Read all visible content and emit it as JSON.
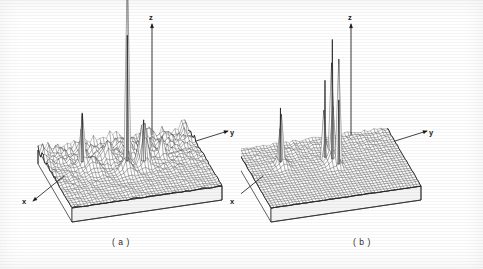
{
  "figure": {
    "background_color": "#ffffff",
    "ink_color": "#1a1a1a",
    "width": 483,
    "height": 269
  },
  "panels": [
    {
      "id": "a",
      "caption": "( a )",
      "axes": {
        "z_label": "z",
        "y_label": "y",
        "x_label": "x"
      }
    },
    {
      "id": "b",
      "caption": "( b )",
      "axes": {
        "z_label": "z",
        "y_label": "y",
        "x_label": "x"
      }
    }
  ],
  "chart_data": [
    {
      "type": "surface",
      "panel": "a",
      "title": "",
      "xlabel": "x",
      "ylabel": "y",
      "zlabel": "z",
      "grid": true,
      "legend": "none",
      "nx": 26,
      "ny": 46,
      "xlim": [
        0,
        1
      ],
      "ylim": [
        0,
        1
      ],
      "zlim": [
        0,
        1
      ],
      "description": "Dense rectangular wireframe mesh on a solid pedestal; one dominant tall central spike plus several medium peaks and a ridge of low-level clutter along the far edge.",
      "peaks": [
        {
          "name": "main-spike",
          "u": 0.5,
          "v": 0.42,
          "height": 1.0,
          "width": 0.012
        },
        {
          "name": "secondary-peak",
          "u": 0.6,
          "v": 0.46,
          "height": 0.34,
          "width": 0.03
        },
        {
          "name": "left-spike",
          "u": 0.22,
          "v": 0.33,
          "height": 0.4,
          "width": 0.016
        },
        {
          "name": "right-sidelobe",
          "u": 0.74,
          "v": 0.37,
          "height": 0.17,
          "width": 0.022
        },
        {
          "name": "ridge-lobe-1",
          "u": 0.4,
          "v": 0.3,
          "height": 0.14,
          "width": 0.035
        },
        {
          "name": "ridge-lobe-2",
          "u": 0.55,
          "v": 0.26,
          "height": 0.12,
          "width": 0.03
        },
        {
          "name": "ridge-lobe-3",
          "u": 0.66,
          "v": 0.3,
          "height": 0.13,
          "width": 0.028
        },
        {
          "name": "near-shoulder",
          "u": 0.47,
          "v": 0.55,
          "height": 0.1,
          "width": 0.04
        },
        {
          "name": "left-shoulder",
          "u": 0.27,
          "v": 0.42,
          "height": 0.09,
          "width": 0.045
        }
      ],
      "clutter_level": 0.055,
      "clutter_edge_bias": 0.7
    },
    {
      "type": "surface",
      "panel": "b",
      "title": "",
      "xlabel": "x",
      "ylabel": "y",
      "zlabel": "z",
      "grid": true,
      "legend": "none",
      "nx": 26,
      "ny": 46,
      "xlim": [
        0,
        1
      ],
      "ylim": [
        0,
        1
      ],
      "zlim": [
        0,
        1
      ],
      "description": "Same mesh geometry as (a) but much cleaner: three tall narrow spikes clustered near centre plus one isolated thin spike at left; background essentially flat.",
      "peaks": [
        {
          "name": "center-spike-tall",
          "u": 0.545,
          "v": 0.4,
          "height": 0.95,
          "width": 0.01
        },
        {
          "name": "center-spike-mid",
          "u": 0.505,
          "v": 0.36,
          "height": 0.62,
          "width": 0.01
        },
        {
          "name": "center-spike-low",
          "u": 0.565,
          "v": 0.5,
          "height": 0.52,
          "width": 0.012
        },
        {
          "name": "left-isolated-spike",
          "u": 0.215,
          "v": 0.33,
          "height": 0.44,
          "width": 0.012
        },
        {
          "name": "center-base-lobe",
          "u": 0.535,
          "v": 0.44,
          "height": 0.12,
          "width": 0.035
        },
        {
          "name": "left-base-lobe",
          "u": 0.225,
          "v": 0.36,
          "height": 0.07,
          "width": 0.035
        }
      ],
      "clutter_level": 0.016,
      "clutter_edge_bias": 0.45
    }
  ]
}
